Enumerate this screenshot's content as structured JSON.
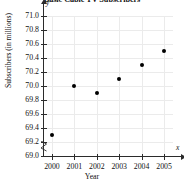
{
  "chart_data": {
    "type": "scatter",
    "title": "Basic Cable TV Subscribers",
    "xlabel": "Year",
    "ylabel": "Subscribers (in millions)",
    "x": [
      2000,
      2001,
      2002,
      2003,
      2004,
      2005
    ],
    "values": [
      69.3,
      70.0,
      69.9,
      70.1,
      70.3,
      70.5
    ],
    "categories": [
      "2000",
      "2001",
      "2002",
      "2003",
      "2004",
      "2005"
    ],
    "xtick_labels": [
      "2000",
      "2001",
      "2002",
      "2003",
      "2004",
      "2005"
    ],
    "ytick_labels": [
      "71.0",
      "70.8",
      "70.6",
      "70.4",
      "70.2",
      "70.0",
      "69.8",
      "69.6",
      "69.4",
      "69.2",
      "69.0"
    ],
    "ytick_values": [
      71.0,
      70.8,
      70.6,
      70.4,
      70.2,
      70.0,
      69.8,
      69.6,
      69.4,
      69.2,
      69.0
    ],
    "xlim": [
      1999.6,
      2005.4
    ],
    "ylim": [
      69.0,
      71.0
    ],
    "grid": true,
    "legend": null,
    "axis_break": {
      "axis": "y",
      "below": 69.0,
      "symbol": "zigzag"
    },
    "axis_end_labels": {
      "x": "x",
      "y": "y"
    },
    "marker": {
      "shape": "circle",
      "color": "#000000"
    },
    "colors": {
      "grid": "#ebebeb",
      "axis": "#2b2b2b",
      "marker": "#000000",
      "text": "#111111",
      "background": "#ffffff"
    }
  }
}
